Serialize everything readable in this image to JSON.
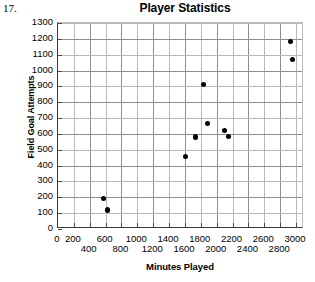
{
  "question_number": "17.",
  "chart_data": {
    "type": "scatter",
    "title": "Player Statistics",
    "xlabel": "Minutes Played",
    "ylabel": "Field Goal Attempts",
    "xlim": [
      0,
      3100
    ],
    "ylim": [
      0,
      1300
    ],
    "grid": true,
    "legend": "none",
    "xticks": [
      0,
      200,
      400,
      600,
      800,
      1000,
      1200,
      1400,
      1600,
      1800,
      2000,
      2200,
      2400,
      2600,
      2800,
      3000
    ],
    "xtick_labels_top": [
      "0",
      "200",
      "600",
      "1000",
      "1400",
      "1800",
      "2200",
      "2600",
      "3000"
    ],
    "xtick_labels_bottom": [
      "400",
      "800",
      "1200",
      "1600",
      "2000",
      "2400",
      "2800"
    ],
    "yticks": [
      0,
      100,
      200,
      300,
      400,
      500,
      600,
      700,
      800,
      900,
      1000,
      1100,
      1200,
      1300
    ],
    "ytick_labels": [
      "1300",
      "1200",
      "1100",
      "1000",
      "900",
      "800",
      "700",
      "600",
      "500",
      "400",
      "300",
      "200",
      "100",
      "0"
    ],
    "points": [
      {
        "x": 570,
        "y": 195
      },
      {
        "x": 625,
        "y": 120
      },
      {
        "x": 1610,
        "y": 455
      },
      {
        "x": 1730,
        "y": 580
      },
      {
        "x": 1830,
        "y": 910
      },
      {
        "x": 1880,
        "y": 665
      },
      {
        "x": 2100,
        "y": 620
      },
      {
        "x": 2150,
        "y": 585
      },
      {
        "x": 2930,
        "y": 1185
      },
      {
        "x": 2960,
        "y": 1070
      }
    ],
    "point_color": "#000000",
    "grid_color": "#b9b9b9",
    "axis_color": "#3a3a3a"
  }
}
